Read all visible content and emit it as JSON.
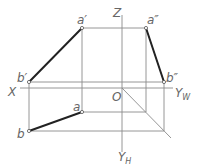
{
  "diagram": {
    "type": "orthographic-projection",
    "colors": {
      "line": "#8a8a8a",
      "thick": "#222222",
      "label": "#666666",
      "background": "#ffffff"
    },
    "axes": {
      "z_label": "Z",
      "x_label": "X",
      "origin_label": "O",
      "yw_label": "Y",
      "yw_sub": "W",
      "yh_label": "Y",
      "yh_sub": "H"
    },
    "points": {
      "a_prime": "a′",
      "b_prime": "b′",
      "a_double_prime": "a″",
      "b_double_prime": "b″",
      "a": "a",
      "b": "b"
    }
  }
}
